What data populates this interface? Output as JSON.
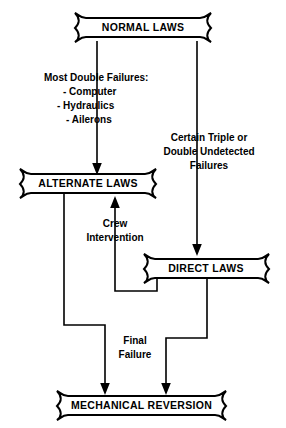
{
  "diagram": {
    "background_color": "#ffffff",
    "line_color": "#000000",
    "nodes": [
      {
        "id": "normal",
        "label": "NORMAL LAWS"
      },
      {
        "id": "alternate",
        "label": "ALTERNATE LAWS"
      },
      {
        "id": "direct",
        "label": "DIRECT LAWS"
      },
      {
        "id": "mechanical",
        "label": "MECHANICAL REVERSION"
      }
    ],
    "edge_labels": {
      "most_double_failures_heading": "Most Double Failures:",
      "failure_item_1": "-  Computer",
      "failure_item_2": "-  Hydraulics",
      "failure_item_3": "-  Ailerons",
      "certain_triple_line1": "Certain Triple or",
      "certain_triple_line2": "Double Undetected",
      "certain_triple_line3": "Failures",
      "crew_line1": "Crew",
      "crew_line2": "Intervention",
      "final_line1": "Final",
      "final_line2": "Failure"
    }
  }
}
